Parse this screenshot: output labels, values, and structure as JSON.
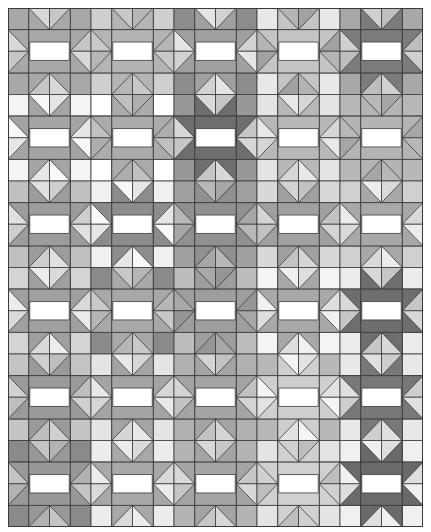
{
  "image": {
    "description": "Grayscale quilt pattern of repeated star blocks with white center bars and diamonds",
    "grid": {
      "block_cols": 5,
      "block_rows": 6,
      "cells_per_block": 4,
      "line_color": "#3a3a3a",
      "bar_color": "#ffffff"
    },
    "stars": [
      [
        "#a8a8a8",
        "#b4b4b4",
        "#a0a0a0",
        "#c4c4c4",
        "#7c7c7c"
      ],
      [
        "#a4a4a4",
        "#ababab",
        "#6e6e6e",
        "#b8b8b8",
        "#b4b4b4"
      ],
      [
        "#9c9c9c",
        "#8c8c8c",
        "#909090",
        "#a0a0a0",
        "#a8a8a8"
      ],
      [
        "#a0a0a0",
        "#a8a8a8",
        "#9e9e9e",
        "#a8a8a8",
        "#6e6e6e"
      ],
      [
        "#9a9a9a",
        "#a4a4a4",
        "#a4a4a4",
        "#cfcfcf",
        "#787878"
      ],
      [
        "#989898",
        "#a8a8a8",
        "#a4a4a4",
        "#d0d0d0",
        "#6a6a6a"
      ]
    ],
    "corners": [
      [
        "#a8a8a8",
        "#cfcfcf",
        "#8c8c8c",
        "#e8e8e8",
        "#a8a8a8"
      ],
      [
        "#f4f4f4",
        "#ffffff",
        "#989898",
        "#e4e4e4",
        "#b8b8b8"
      ],
      [
        "#c0c0c0",
        "#f0f0f0",
        "#a0a0a0",
        "#d8d8d8",
        "#d0d0d0"
      ],
      [
        "#d4d4d4",
        "#8a8a8a",
        "#bcbcbc",
        "#f4f4f4",
        "#ececec"
      ],
      [
        "#c4c4c4",
        "#e4e4e4",
        "#b0b0b0",
        "#b8b8b8",
        "#e8e8e8"
      ],
      [
        "#8a8a8a",
        "#ececec",
        "#b4b4b4",
        "#e4e4e4",
        "#f0f0f0"
      ]
    ],
    "diamonds": [
      [
        "#d8d8d8",
        "#c8c8c8",
        "#e4e4e4",
        "#b4b4b4",
        "#d0d0d0"
      ],
      [
        "#f8f8f8",
        "#c0c0c0",
        "#d8d8d8",
        "#e8e8e8",
        "#b8b8b8"
      ],
      [
        "#e0e0e0",
        "#f8f8f8",
        "#b8b8b8",
        "#d4d4d4",
        "#ececec"
      ],
      [
        "#ececec",
        "#c8c8c8",
        "#a8a8a8",
        "#f0f0f0",
        "#d8d8d8"
      ],
      [
        "#d0d0d0",
        "#e8e8e8",
        "#d4d4d4",
        "#f4f4f4",
        "#e0e0e0"
      ],
      [
        "#c4c4c4",
        "#ececec",
        "#d8d8d8",
        "#d0d0d0",
        "#f0f0f0"
      ]
    ]
  }
}
